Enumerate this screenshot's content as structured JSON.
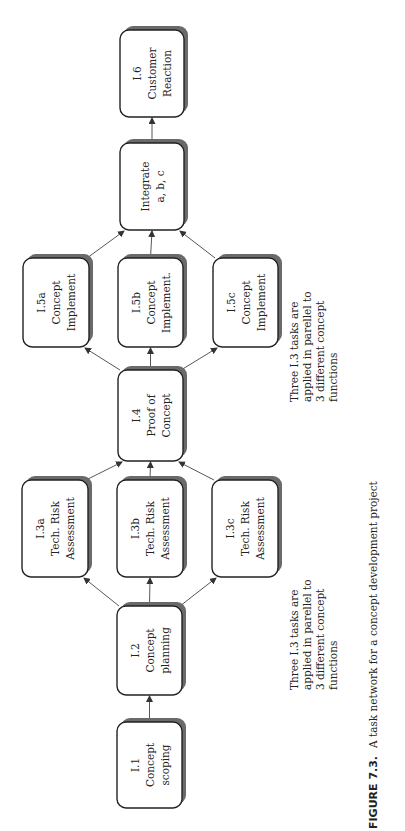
{
  "figure": {
    "caption_label": "FIGURE 7.3.",
    "caption_text": "A task network for a concept development project"
  },
  "colors": {
    "box_fill": "#ffffff",
    "box_stroke": "#222222",
    "shadow": "#6a6a6a",
    "arrow": "#444444"
  },
  "nodes": [
    {
      "id": "I.1",
      "lines": [
        "I.1",
        "Concept",
        "scoping"
      ],
      "x": 117,
      "y": 722,
      "w": 65,
      "h": 86
    },
    {
      "id": "I.2",
      "lines": [
        "I.2",
        "Concept",
        "planning"
      ],
      "x": 117,
      "y": 606,
      "w": 65,
      "h": 89
    },
    {
      "id": "I.3a",
      "lines": [
        "I.3a",
        "Tech. Risk",
        "Assessment"
      ],
      "x": 22,
      "y": 480,
      "w": 66,
      "h": 97
    },
    {
      "id": "I.3b",
      "lines": [
        "I.3b",
        "Tech. Risk",
        "Assessment"
      ],
      "x": 117,
      "y": 480,
      "w": 66,
      "h": 97
    },
    {
      "id": "I.3c",
      "lines": [
        "I.3c",
        "Tech. Risk",
        "Assessment"
      ],
      "x": 212,
      "y": 480,
      "w": 66,
      "h": 97
    },
    {
      "id": "I.4",
      "lines": [
        "I.4",
        "Proof of",
        "Concept"
      ],
      "x": 118,
      "y": 370,
      "w": 65,
      "h": 91
    },
    {
      "id": "I.5a",
      "lines": [
        "I.5a",
        "Concept",
        "Implement"
      ],
      "x": 23,
      "y": 258,
      "w": 66,
      "h": 89
    },
    {
      "id": "I.5b",
      "lines": [
        "I.5b",
        "Concept",
        "Implement."
      ],
      "x": 118,
      "y": 258,
      "w": 65,
      "h": 89
    },
    {
      "id": "I.5c",
      "lines": [
        "I.5c",
        "Concept",
        "Implement"
      ],
      "x": 213,
      "y": 258,
      "w": 65,
      "h": 89
    },
    {
      "id": "Integrate",
      "lines": [
        "Integrate",
        "a, b, c"
      ],
      "x": 120,
      "y": 143,
      "w": 64,
      "h": 87
    },
    {
      "id": "I.6",
      "lines": [
        "I.6",
        "Customer",
        "Reaction"
      ],
      "x": 120,
      "y": 30,
      "w": 64,
      "h": 87
    }
  ],
  "edges": [
    {
      "from": "I.1",
      "to": "I.2"
    },
    {
      "from": "I.2",
      "to": "I.3a"
    },
    {
      "from": "I.2",
      "to": "I.3b"
    },
    {
      "from": "I.2",
      "to": "I.3c"
    },
    {
      "from": "I.3a",
      "to": "I.4"
    },
    {
      "from": "I.3b",
      "to": "I.4"
    },
    {
      "from": "I.3c",
      "to": "I.4"
    },
    {
      "from": "I.4",
      "to": "I.5a"
    },
    {
      "from": "I.4",
      "to": "I.5b"
    },
    {
      "from": "I.4",
      "to": "I.5c"
    },
    {
      "from": "I.5a",
      "to": "Integrate"
    },
    {
      "from": "I.5b",
      "to": "Integrate"
    },
    {
      "from": "I.5c",
      "to": "Integrate"
    },
    {
      "from": "Integrate",
      "to": "I.6"
    }
  ],
  "notes": [
    {
      "lines": [
        "Three I.3 tasks are",
        "applied in parellel to",
        "3 different concept",
        "functions"
      ],
      "x": 298,
      "y": 690
    },
    {
      "lines": [
        "Three I.3 tasks are",
        "applied in parellel to",
        "3 different concept",
        "functions"
      ],
      "x": 298,
      "y": 402
    }
  ]
}
